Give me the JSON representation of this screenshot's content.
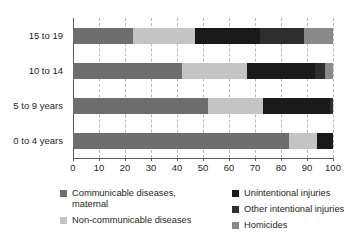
{
  "chart_data": {
    "type": "bar",
    "orientation": "horizontal",
    "stacked": true,
    "normalized": true,
    "title": "",
    "subtitle": "",
    "xlabel": "",
    "ylabel": "",
    "xlim": [
      0,
      100
    ],
    "xticks": [
      0,
      10,
      20,
      30,
      40,
      50,
      60,
      70,
      80,
      90,
      100
    ],
    "xtick_labels": [
      "0",
      "10",
      "20",
      "30",
      "40",
      "50",
      "60",
      "70",
      "80",
      "90",
      "100"
    ],
    "grid": "vertical-dashed",
    "legend_position": "bottom",
    "categories": [
      "0 to 4 years",
      "5 to 9 years",
      "10 to 14",
      "15 to 19"
    ],
    "categories_top_to_bottom": [
      "15 to 19",
      "10 to 14",
      "5 to 9 years",
      "0 to 4 years"
    ],
    "series": [
      {
        "name": "Communicable diseases, maternal",
        "legend_label": "Communicable diseases,\nmaternal",
        "color": "#6e6e6e",
        "values_top_to_bottom": [
          23,
          42,
          52,
          83
        ]
      },
      {
        "name": "Non-communicable diseases",
        "legend_label": "Non-communicable diseases",
        "color": "#c4c4c4",
        "values_top_to_bottom": [
          24,
          25,
          21,
          11
        ]
      },
      {
        "name": "Unintentional injuries",
        "legend_label": "Unintentional injuries",
        "color": "#1a1a1a",
        "values_top_to_bottom": [
          25,
          26,
          26,
          6
        ]
      },
      {
        "name": "Other intentional injuries",
        "legend_label": "Other intentional injuries",
        "color": "#2e2e2e",
        "values_top_to_bottom": [
          17,
          4,
          1,
          0
        ]
      },
      {
        "name": "Homicides",
        "legend_label": "Homicides",
        "color": "#8a8a8a",
        "values_top_to_bottom": [
          11,
          3,
          0,
          0
        ]
      }
    ]
  },
  "axis": {
    "grid_color": "#b9b9b9",
    "axis_color": "#5a5a5a"
  }
}
